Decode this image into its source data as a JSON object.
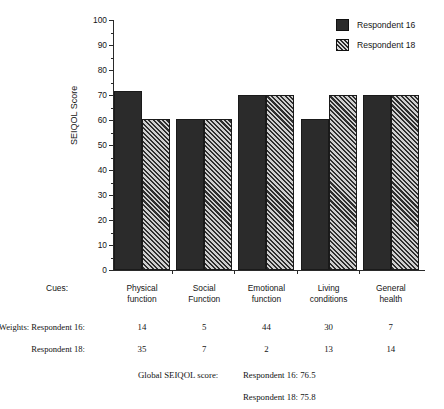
{
  "chart_data": {
    "type": "bar",
    "title": "",
    "xlabel": "",
    "ylabel": "SEIQOL Score",
    "ylim": [
      0,
      100
    ],
    "ytick_step": 10,
    "grid": false,
    "legend_position": "top-right",
    "categories": [
      "Physical function",
      "Social Function",
      "Emotional function",
      "Living conditions",
      "General health"
    ],
    "category_lines": [
      [
        "Physical",
        "function"
      ],
      [
        "Social",
        "Function"
      ],
      [
        "Emotional",
        "function"
      ],
      [
        "Living",
        "conditions"
      ],
      [
        "General",
        "health"
      ]
    ],
    "yticks": [
      0,
      10,
      20,
      30,
      40,
      50,
      60,
      70,
      80,
      90,
      100
    ],
    "series": [
      {
        "name": "Respondent 16",
        "fill": "solid",
        "values": [
          71.5,
          60.5,
          70,
          60.5,
          70
        ]
      },
      {
        "name": "Respondent 18",
        "fill": "hatch",
        "values": [
          60.5,
          60.5,
          70,
          70,
          70
        ]
      }
    ]
  },
  "legend": {
    "items": [
      {
        "label": "Respondent 16",
        "fill": "solid"
      },
      {
        "label": "Respondent 18",
        "fill": "hatch"
      }
    ]
  },
  "table": {
    "cues_label": "Cues:",
    "weights_row1_label": "Weights: Respondent 16:",
    "weights_row2_label": "Respondent 18:",
    "weights_16": [
      "14",
      "5",
      "44",
      "30",
      "7"
    ],
    "weights_18": [
      "35",
      "7",
      "2",
      "13",
      "14"
    ]
  },
  "global_score": {
    "label": "Global SEIQOL score:",
    "line1": "Respondent 16: 76.5",
    "line2": "Respondent 18: 75.8"
  },
  "colors": {
    "bar_solid": "#2b2b2b",
    "bar_hatch": "#2f2f2f",
    "axis": "#2a2a2a",
    "text": "#151515",
    "background": "#ffffff"
  }
}
